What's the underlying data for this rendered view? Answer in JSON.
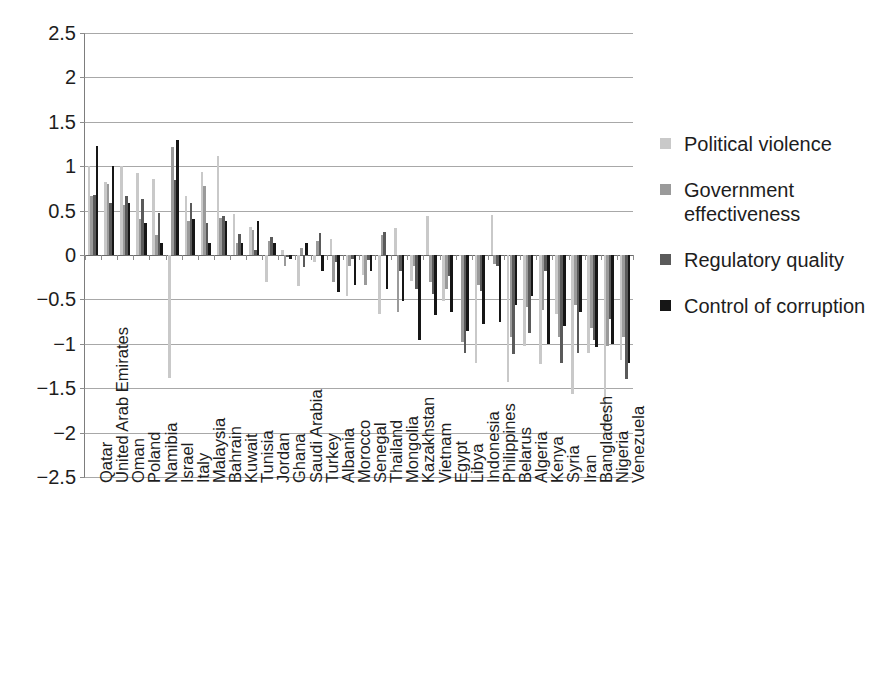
{
  "chart_data": {
    "type": "bar",
    "title": "",
    "subtitle": "",
    "xlabel": "",
    "ylabel": "",
    "ylim": [
      -2.5,
      2.5
    ],
    "ytick_labels": [
      "2.5",
      "2",
      "1.5",
      "1",
      "0.5",
      "0",
      "-0.5",
      "-1",
      "-1.5",
      "-2",
      "-2.5"
    ],
    "ytick_values": [
      2.5,
      2,
      1.5,
      1,
      0.5,
      0,
      -0.5,
      -1,
      -1.5,
      -2,
      -2.5
    ],
    "grid": true,
    "legend_position": "right",
    "orientation": "vertical",
    "grouped": true,
    "categories": [
      "Qatar",
      "United Arab Emirates",
      "Oman",
      "Poland",
      "Namibia",
      "Israel",
      "Italy",
      "Malaysia",
      "Bahrain",
      "Kuwait",
      "Tunisia",
      "Jordan",
      "Ghana",
      "Saudi Arabia",
      "Turkey",
      "Albania",
      "Morocco",
      "Senegal",
      "Thailand",
      "Mongolia",
      "Kazakhstan",
      "Vietnam",
      "Egypt",
      "Libya",
      "Indonesia",
      "Philippines",
      "Belarus",
      "Algeria",
      "Kenya",
      "Syria",
      "Iran",
      "Bangladesh",
      "Nigeria",
      "Venezuela"
    ],
    "series": [
      {
        "name": "Political violence",
        "color": "#c9c9c9",
        "values": [
          1.0,
          0.82,
          1.0,
          0.92,
          0.86,
          -1.39,
          0.66,
          0.94,
          1.12,
          0.46,
          0.31,
          -0.3,
          0.06,
          -0.35,
          -0.08,
          0.18,
          -0.46,
          -0.23,
          -0.67,
          0.3,
          -0.29,
          0.44,
          -0.52,
          -0.01,
          -1.22,
          0.45,
          -1.43,
          -1.02,
          -1.23,
          -0.67,
          -1.56,
          -1.1,
          -2.02,
          -1.18
        ]
      },
      {
        "name": "Government effectiveness",
        "color": "#9a9a9a",
        "values": [
          0.66,
          0.8,
          0.56,
          0.4,
          0.22,
          1.22,
          0.38,
          0.78,
          0.42,
          0.14,
          0.28,
          0.16,
          -0.12,
          0.08,
          0.16,
          -0.3,
          -0.12,
          -0.34,
          0.22,
          -0.64,
          -0.12,
          -0.3,
          -0.38,
          -0.98,
          -0.34,
          -0.1,
          -0.92,
          -0.58,
          -0.62,
          -0.92,
          -0.56,
          -0.82,
          -1.02,
          -0.92
        ]
      },
      {
        "name": "Regulatory quality",
        "color": "#5a5a5a",
        "values": [
          0.68,
          0.59,
          0.66,
          0.63,
          0.47,
          0.85,
          0.59,
          0.36,
          0.44,
          0.24,
          0.06,
          0.2,
          -0.02,
          -0.14,
          0.25,
          -0.08,
          -0.04,
          -0.06,
          0.26,
          -0.18,
          -0.38,
          -0.44,
          -0.24,
          -1.1,
          -0.4,
          -0.12,
          -1.12,
          -0.88,
          -0.18,
          -1.22,
          -1.1,
          -0.96,
          -0.72,
          -1.4
        ]
      },
      {
        "name": "Control of corruption",
        "color": "#161616",
        "values": [
          1.23,
          1.0,
          0.58,
          0.36,
          0.13,
          1.29,
          0.4,
          0.14,
          0.38,
          0.13,
          0.38,
          0.14,
          -0.04,
          0.13,
          -0.18,
          -0.42,
          -0.34,
          -0.18,
          -0.38,
          -0.52,
          -0.96,
          -0.68,
          -0.64,
          -0.86,
          -0.78,
          -0.76,
          -0.56,
          -0.46,
          -1.0,
          -0.8,
          -0.64,
          -1.04,
          -1.0,
          -1.22
        ]
      }
    ]
  },
  "legend": {
    "entries": [
      {
        "label": "Political violence",
        "color": "#c9c9c9"
      },
      {
        "label": "Government effectiveness",
        "color": "#9a9a9a"
      },
      {
        "label": "Regulatory quality",
        "color": "#5a5a5a"
      },
      {
        "label": "Control of corruption",
        "color": "#161616"
      }
    ]
  }
}
